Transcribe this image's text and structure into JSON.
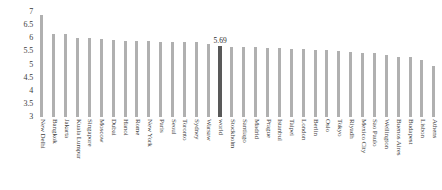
{
  "chart_data": {
    "type": "bar",
    "title": "",
    "subtitle": "",
    "xlabel": "",
    "ylabel": "",
    "ylim": [
      3,
      7
    ],
    "grid": false,
    "legend": null,
    "yticks": [
      "3",
      "3.5",
      "4",
      "4.5",
      "5",
      "5.5",
      "6",
      "6.5",
      "7"
    ],
    "ytick_values": [
      3,
      3.5,
      4,
      4.5,
      5,
      5.5,
      6,
      6.5,
      7
    ],
    "highlight_category": "world",
    "highlight_label": "5.69",
    "colors": {
      "bar": "#b0b0b0",
      "bar_highlight": "#595959",
      "text": "#3b3b3b",
      "background": "#ffffff"
    },
    "categories": [
      "New Delhi",
      "Bangkok",
      "Jakarta",
      "Kuala Lumpur",
      "Singapore",
      "Moscow",
      "Dubai",
      "Hanoi",
      "Rome",
      "New York",
      "Paris",
      "Seoul",
      "Toronto",
      "Sydney",
      "Warsaw",
      "world",
      "Stockholm",
      "Santiago",
      "Madrid",
      "Prague",
      "Istanbul",
      "Taipei",
      "London",
      "Berlin",
      "Oslo",
      "Tokyo",
      "Riyadh",
      "Mexico City",
      "Sao Paulo",
      "Wellington",
      "Buenos Aires",
      "Budapest",
      "Lisbon",
      "Athens"
    ],
    "values": [
      6.9,
      6.15,
      6.15,
      6.02,
      6.0,
      5.96,
      5.92,
      5.9,
      5.88,
      5.88,
      5.86,
      5.86,
      5.86,
      5.85,
      5.8,
      5.69,
      5.68,
      5.66,
      5.65,
      5.64,
      5.62,
      5.6,
      5.58,
      5.56,
      5.54,
      5.52,
      5.48,
      5.44,
      5.42,
      5.38,
      5.3,
      5.28,
      5.18,
      4.95
    ]
  }
}
